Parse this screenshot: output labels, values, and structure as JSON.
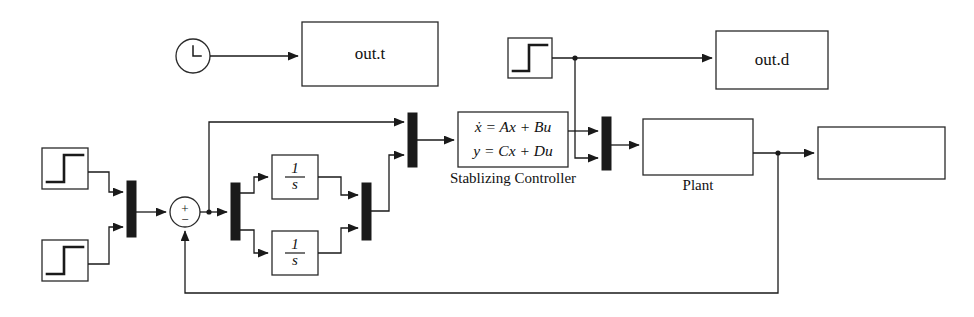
{
  "diagram": {
    "canvas": {
      "width": 974,
      "height": 317
    },
    "colors": {
      "line": "#1a1a1a",
      "block_stroke": "#2a2a2a",
      "block_fill": "#ffffff",
      "mux_fill": "#1a1a1a",
      "text": "#111111",
      "background": "#ffffff"
    },
    "blocks": [
      {
        "id": "clock",
        "type": "clock-source",
        "name": "clock-block",
        "label": "",
        "x": 176,
        "y": 39,
        "w": 34,
        "h": 34
      },
      {
        "id": "out_t",
        "type": "output-sink",
        "name": "out-t-sink",
        "label": "out.t",
        "x": 302,
        "y": 22,
        "w": 136,
        "h": 64
      },
      {
        "id": "step_d",
        "type": "step-source",
        "name": "disturbance-step-block",
        "label": "",
        "x": 508,
        "y": 38,
        "w": 44,
        "h": 40
      },
      {
        "id": "out_d",
        "type": "output-sink",
        "name": "out-d-sink",
        "label": "out.d",
        "x": 716,
        "y": 31,
        "w": 112,
        "h": 58
      },
      {
        "id": "step_r1",
        "type": "step-source",
        "name": "reference-step-block-1",
        "label": "",
        "x": 42,
        "y": 148,
        "w": 46,
        "h": 41
      },
      {
        "id": "step_r2",
        "type": "step-source",
        "name": "reference-step-block-2",
        "label": "",
        "x": 42,
        "y": 240,
        "w": 46,
        "h": 41
      },
      {
        "id": "mux_in",
        "type": "mux",
        "name": "input-mux-block",
        "label": "",
        "x": 127,
        "y": 181,
        "w": 9,
        "h": 56
      },
      {
        "id": "sum",
        "type": "sum-junction",
        "name": "sum-junction-block",
        "label": "",
        "cx": 185,
        "cy": 212,
        "r": 15,
        "plus": "+",
        "minus": "−"
      },
      {
        "id": "demux",
        "type": "demux",
        "name": "state-demux-block",
        "label": "",
        "x": 231,
        "y": 183,
        "w": 9,
        "h": 57
      },
      {
        "id": "int1",
        "type": "integrator",
        "name": "integrator-block-1",
        "numerator": "1",
        "denominator": "s",
        "x": 272,
        "y": 155,
        "w": 46,
        "h": 44
      },
      {
        "id": "int2",
        "type": "integrator",
        "name": "integrator-block-2",
        "numerator": "1",
        "denominator": "s",
        "x": 272,
        "y": 231,
        "w": 46,
        "h": 44
      },
      {
        "id": "mux_state",
        "type": "mux",
        "name": "state-mux-block",
        "label": "",
        "x": 362,
        "y": 183,
        "w": 9,
        "h": 57
      },
      {
        "id": "mux_ctrl",
        "type": "mux",
        "name": "controller-input-mux-block",
        "label": "",
        "x": 408,
        "y": 113,
        "w": 9,
        "h": 54
      },
      {
        "id": "controller",
        "type": "state-space",
        "name": "stabilizing-controller-block",
        "eq1": "ẋ = Ax + Bu",
        "eq2": "y = Cx + Du",
        "caption": "Stablizing Controller",
        "x": 458,
        "y": 112,
        "w": 110,
        "h": 55
      },
      {
        "id": "mux_plant",
        "type": "mux",
        "name": "plant-input-mux-block",
        "label": "",
        "x": 602,
        "y": 117,
        "w": 9,
        "h": 53
      },
      {
        "id": "plant",
        "type": "state-space",
        "name": "plant-block",
        "eq1": "ẋ = Ax + Bu",
        "eq2": "y = Cx + Du",
        "caption": "Plant",
        "x": 643,
        "y": 119,
        "w": 110,
        "h": 56
      },
      {
        "id": "out_y",
        "type": "output-sink",
        "name": "out-y-sink",
        "label": "out.y",
        "x": 818,
        "y": 127,
        "w": 127,
        "h": 52
      }
    ],
    "captions": [
      {
        "id": "cap_ctrl",
        "text": "Stablizing Controller",
        "x": 513,
        "y": 180
      },
      {
        "id": "cap_plant",
        "text": "Plant",
        "x": 698,
        "y": 187
      }
    ],
    "signals": [
      {
        "id": "s_clock_outt",
        "from": "clock",
        "to": "out_t",
        "name": "clock-to-out-t-signal"
      },
      {
        "id": "s_stepd_outd",
        "from": "step_d",
        "to": "out_d",
        "name": "disturbance-to-out-d-signal"
      },
      {
        "id": "s_stepd_muxplant",
        "from": "step_d",
        "to": "mux_plant",
        "name": "disturbance-to-plant-mux-signal"
      },
      {
        "id": "s_r1_mux",
        "from": "step_r1",
        "to": "mux_in",
        "name": "reference-1-to-mux-signal"
      },
      {
        "id": "s_r2_mux",
        "from": "step_r2",
        "to": "mux_in",
        "name": "reference-2-to-mux-signal"
      },
      {
        "id": "s_mux_sum",
        "from": "mux_in",
        "to": "sum",
        "name": "mux-to-sum-signal"
      },
      {
        "id": "s_sum_demux",
        "from": "sum",
        "to": "demux",
        "name": "sum-to-demux-signal"
      },
      {
        "id": "s_sum_muxctrl",
        "from": "sum",
        "to": "mux_ctrl",
        "name": "sum-to-controller-mux-signal"
      },
      {
        "id": "s_demux_int1",
        "from": "demux",
        "to": "int1",
        "name": "demux-to-integrator-1-signal"
      },
      {
        "id": "s_demux_int2",
        "from": "demux",
        "to": "int2",
        "name": "demux-to-integrator-2-signal"
      },
      {
        "id": "s_int1_muxstate",
        "from": "int1",
        "to": "mux_state",
        "name": "integrator-1-to-state-mux-signal"
      },
      {
        "id": "s_int2_muxstate",
        "from": "int2",
        "to": "mux_state",
        "name": "integrator-2-to-state-mux-signal"
      },
      {
        "id": "s_muxstate_muxctrl",
        "from": "mux_state",
        "to": "mux_ctrl",
        "name": "state-mux-to-controller-mux-signal"
      },
      {
        "id": "s_muxctrl_ctrl",
        "from": "mux_ctrl",
        "to": "controller",
        "name": "controller-mux-to-controller-signal"
      },
      {
        "id": "s_ctrl_muxplant",
        "from": "controller",
        "to": "mux_plant",
        "name": "controller-to-plant-mux-signal"
      },
      {
        "id": "s_muxplant_plant",
        "from": "mux_plant",
        "to": "plant",
        "name": "plant-mux-to-plant-signal"
      },
      {
        "id": "s_plant_outy",
        "from": "plant",
        "to": "out_y",
        "name": "plant-to-out-y-signal"
      },
      {
        "id": "s_feedback",
        "from": "plant",
        "to": "sum",
        "name": "plant-output-feedback-signal"
      }
    ],
    "junctions": [
      {
        "id": "j_stepd",
        "name": "disturbance-branch-point",
        "x": 575,
        "y": 58
      },
      {
        "id": "j_sum",
        "name": "sum-output-branch-point",
        "x": 209,
        "y": 212
      },
      {
        "id": "j_plant",
        "name": "plant-output-branch-point",
        "x": 778,
        "y": 153
      }
    ]
  }
}
